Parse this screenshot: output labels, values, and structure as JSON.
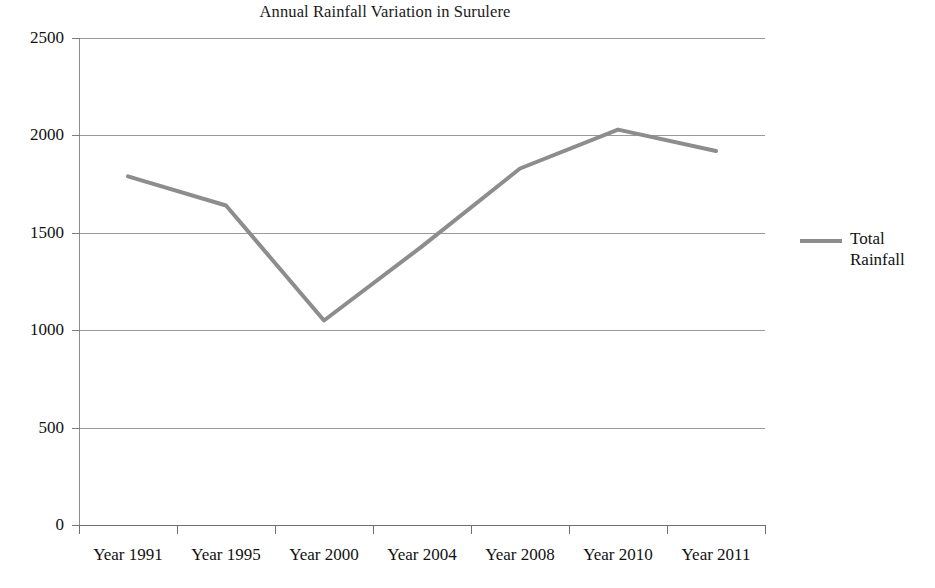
{
  "chart_data": {
    "type": "line",
    "title": "Annual Rainfall Variation in Surulere",
    "xlabel": "",
    "ylabel": "",
    "categories": [
      "Year 1991",
      "Year 1995",
      "Year 2000",
      "Year 2004",
      "Year 2008",
      "Year 2010",
      "Year 2011"
    ],
    "series": [
      {
        "name": "Total Rainfall",
        "values": [
          1790,
          1640,
          1050,
          1430,
          1830,
          2030,
          1920
        ],
        "color": "#8d8d8d"
      }
    ],
    "ylim": [
      0,
      2500
    ],
    "yticks": [
      0,
      500,
      1000,
      1500,
      2000,
      2500
    ],
    "ytick_labels": [
      "0",
      "500",
      "1000",
      "1500",
      "2000",
      "2500"
    ],
    "grid": true,
    "grid_axis": "y",
    "legend_position": "right",
    "legend_entries": [
      "Total Rainfall"
    ],
    "markers": false,
    "line_width": 4
  },
  "legend": {
    "label_line1": "Total",
    "label_line2": "Rainfall",
    "swatch_name": "line-swatch"
  }
}
